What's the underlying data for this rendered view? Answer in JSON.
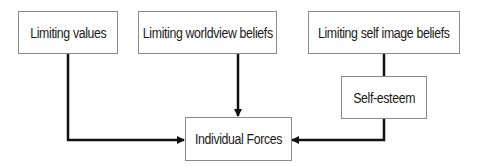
{
  "diagram": {
    "nodes": {
      "limiting_values": {
        "label": "Limiting values"
      },
      "limiting_worldview": {
        "label": "Limiting worldview beliefs"
      },
      "limiting_self_image": {
        "label": "Limiting self image beliefs"
      },
      "self_esteem": {
        "label": "Self-esteem"
      },
      "individual_forces": {
        "label": "Individual Forces"
      }
    },
    "edges": [
      {
        "from": "Limiting values",
        "to": "Individual Forces",
        "arrow": true
      },
      {
        "from": "Limiting worldview beliefs",
        "to": "Individual Forces",
        "arrow": true
      },
      {
        "from": "Limiting self image beliefs",
        "to": "Self-esteem",
        "arrow": false
      },
      {
        "from": "Self-esteem",
        "to": "Individual Forces",
        "arrow": true
      }
    ],
    "colors": {
      "line": "#111111",
      "box_border": "#8a8a8a",
      "text": "#1a1a1a"
    }
  }
}
